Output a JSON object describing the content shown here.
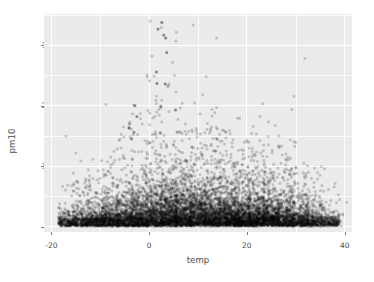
{
  "chart_data": {
    "type": "scatter",
    "title": "",
    "xlabel": "temp",
    "ylabel": "pm10",
    "xlim": [
      -21.5,
      41.5
    ],
    "ylim": [
      -9,
      352
    ],
    "grid": true,
    "legend": "none",
    "point_color": "#000000",
    "point_alpha": 0.18,
    "point_size": 1.5,
    "panel_background": "#ebebeb",
    "gridline_color": "#ffffff",
    "text_color": "#4d4d4d",
    "x_ticks": [
      {
        "value": -20,
        "label": "-20"
      },
      {
        "value": 0,
        "label": "0"
      },
      {
        "value": 20,
        "label": "20"
      },
      {
        "value": 40,
        "label": "40"
      }
    ],
    "y_ticks": [
      {
        "value": 0,
        "label": "0"
      },
      {
        "value": 100,
        "label": "100"
      },
      {
        "value": 200,
        "label": "200"
      },
      {
        "value": 300,
        "label": "300"
      }
    ],
    "x_minor_ticks": [
      -10,
      10,
      30
    ],
    "y_minor_ticks": [
      50,
      150,
      250,
      350
    ],
    "n_points": 7200,
    "density_bands": [
      {
        "x_center": -17,
        "y_median": 18,
        "y_spread": 13,
        "count": 90,
        "tail_max": 70
      },
      {
        "x_center": -14,
        "y_median": 20,
        "y_spread": 15,
        "count": 160,
        "tail_max": 85
      },
      {
        "x_center": -11,
        "y_median": 21,
        "y_spread": 16,
        "count": 230,
        "tail_max": 95
      },
      {
        "x_center": -8,
        "y_median": 23,
        "y_spread": 18,
        "count": 300,
        "tail_max": 130
      },
      {
        "x_center": -5,
        "y_median": 25,
        "y_spread": 20,
        "count": 360,
        "tail_max": 175
      },
      {
        "x_center": -2,
        "y_median": 27,
        "y_spread": 23,
        "count": 430,
        "tail_max": 205
      },
      {
        "x_center": 1,
        "y_median": 30,
        "y_spread": 27,
        "count": 500,
        "tail_max": 250
      },
      {
        "x_center": 4,
        "y_median": 32,
        "y_spread": 30,
        "count": 540,
        "tail_max": 340
      },
      {
        "x_center": 7,
        "y_median": 33,
        "y_spread": 30,
        "count": 550,
        "tail_max": 195
      },
      {
        "x_center": 10,
        "y_median": 32,
        "y_spread": 28,
        "count": 540,
        "tail_max": 180
      },
      {
        "x_center": 13,
        "y_median": 30,
        "y_spread": 25,
        "count": 520,
        "tail_max": 170
      },
      {
        "x_center": 16,
        "y_median": 29,
        "y_spread": 23,
        "count": 510,
        "tail_max": 160
      },
      {
        "x_center": 19,
        "y_median": 28,
        "y_spread": 22,
        "count": 500,
        "tail_max": 150
      },
      {
        "x_center": 22,
        "y_median": 28,
        "y_spread": 21,
        "count": 480,
        "tail_max": 145
      },
      {
        "x_center": 25,
        "y_median": 27,
        "y_spread": 20,
        "count": 430,
        "tail_max": 140
      },
      {
        "x_center": 28,
        "y_median": 26,
        "y_spread": 19,
        "count": 360,
        "tail_max": 130
      },
      {
        "x_center": 31,
        "y_median": 25,
        "y_spread": 17,
        "count": 260,
        "tail_max": 110
      },
      {
        "x_center": 34,
        "y_median": 23,
        "y_spread": 15,
        "count": 150,
        "tail_max": 90
      },
      {
        "x_center": 37,
        "y_median": 21,
        "y_spread": 13,
        "count": 60,
        "tail_max": 60
      },
      {
        "x_center": 39,
        "y_median": 19,
        "y_spread": 11,
        "count": 18,
        "tail_max": 45
      }
    ],
    "notable_outliers": [
      {
        "x": 2.6,
        "y": 338
      },
      {
        "x": 1.8,
        "y": 327
      },
      {
        "x": 3.0,
        "y": 317
      },
      {
        "x": 3.4,
        "y": 312
      },
      {
        "x": 3.6,
        "y": 288
      },
      {
        "x": 1.5,
        "y": 256
      },
      {
        "x": 1.6,
        "y": 237
      },
      {
        "x": 3.3,
        "y": 236
      },
      {
        "x": -2.9,
        "y": 200
      },
      {
        "x": 2.4,
        "y": 199
      },
      {
        "x": 5.4,
        "y": 193
      },
      {
        "x": -2.5,
        "y": 182
      },
      {
        "x": -4.1,
        "y": 163
      },
      {
        "x": -3.1,
        "y": 156
      },
      {
        "x": 2.3,
        "y": 155
      },
      {
        "x": -3.6,
        "y": 145
      }
    ]
  }
}
